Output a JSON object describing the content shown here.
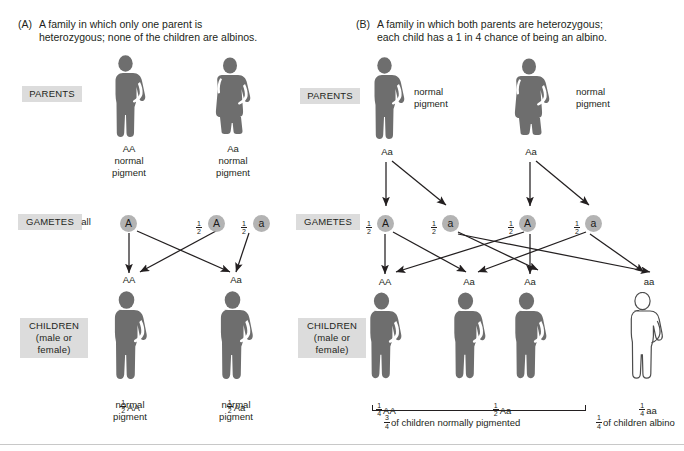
{
  "figure": {
    "title_a_tag": "(A)",
    "title_a_text": "A family in which only one parent is heterozygous; none of the children are albinos.",
    "title_b_tag": "(B)",
    "title_b_text": "A family in which both parents are heterozygous; each child has a 1 in 4 chance of being an albino."
  },
  "colors": {
    "person_dark": "#6e6e6e",
    "person_outline": "#4d4d4d",
    "gamete_fill": "#b3b3b3",
    "label_bg": "#dcdcdc",
    "ink": "#231f20",
    "albino_fill": "#ffffff"
  },
  "stage_labels": {
    "parents": "PARENTS",
    "gametes": "GAMETES",
    "children": "CHILDREN\n(male or\nfemale)"
  },
  "panel_a": {
    "parents": [
      {
        "genotype": "AA",
        "phenotype": "normal\npigment",
        "sex": "male",
        "fill": "dark"
      },
      {
        "genotype": "Aa",
        "phenotype": "normal\npigment",
        "sex": "female",
        "fill": "dark"
      }
    ],
    "gametes": [
      {
        "prefix": "all",
        "allele": "A"
      },
      {
        "prefix": "1/2",
        "allele": "A"
      },
      {
        "prefix": "1/2",
        "allele": "a"
      }
    ],
    "children": [
      {
        "genotype": "AA",
        "ratio": "1/2",
        "ratio_genotype": "AA",
        "phenotype": "normal\npigment",
        "fill": "dark"
      },
      {
        "genotype": "Aa",
        "ratio": "1/2",
        "ratio_genotype": "Aa",
        "phenotype": "normal\npigment",
        "fill": "dark"
      }
    ]
  },
  "panel_b": {
    "parents": [
      {
        "genotype": "Aa",
        "phenotype": "normal\npigment",
        "sex": "male",
        "fill": "dark"
      },
      {
        "genotype": "Aa",
        "phenotype": "normal\npigment",
        "sex": "female",
        "fill": "dark"
      }
    ],
    "gametes": [
      {
        "prefix": "1/2",
        "allele": "A"
      },
      {
        "prefix": "1/2",
        "allele": "a"
      },
      {
        "prefix": "1/2",
        "allele": "A"
      },
      {
        "prefix": "1/2",
        "allele": "a"
      }
    ],
    "children": [
      {
        "genotype": "AA",
        "ratio": "1/4",
        "ratio_genotype": "AA",
        "fill": "dark"
      },
      {
        "genotype": "Aa",
        "ratio": "1/2",
        "ratio_genotype": "Aa",
        "fill": "dark"
      },
      {
        "genotype": "Aa",
        "ratio": "",
        "ratio_genotype": "",
        "fill": "dark"
      },
      {
        "genotype": "aa",
        "ratio": "1/4",
        "ratio_genotype": "aa",
        "fill": "albino"
      }
    ],
    "summary_normal": "of children normally pigmented",
    "summary_normal_frac": "3/4",
    "summary_albino": "of children albino",
    "summary_albino_frac": "1/4"
  }
}
